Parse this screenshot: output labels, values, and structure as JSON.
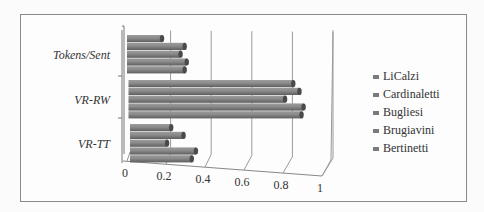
{
  "chart_data": {
    "type": "bar",
    "orientation": "horizontal",
    "style": "3d-cylinder",
    "title": "",
    "xlabel": "",
    "ylabel": "",
    "categories": [
      "Tokens/Sent",
      "VR-RW",
      "VR-TT"
    ],
    "xlim": [
      0,
      1
    ],
    "x_ticks": [
      "0",
      "0.2",
      "0.4",
      "0.6",
      "0.8",
      "1"
    ],
    "grid": true,
    "legend_position": "right",
    "series": [
      {
        "name": "LiCalzi",
        "values": [
          0.17,
          0.8,
          0.2
        ]
      },
      {
        "name": "Cardinaletti",
        "values": [
          0.28,
          0.83,
          0.26
        ]
      },
      {
        "name": "Bugliesi",
        "values": [
          0.26,
          0.76,
          0.18
        ]
      },
      {
        "name": "Brugiavini",
        "values": [
          0.29,
          0.85,
          0.32
        ]
      },
      {
        "name": "Bertinetti",
        "values": [
          0.28,
          0.84,
          0.3
        ]
      }
    ],
    "colors": {
      "bar": "#7a7a7a",
      "bar_highlight": "#9a9a9a",
      "bar_cap": "#4a4a4a",
      "grid": "#9a9a9a",
      "frame": "#8a8a8a"
    }
  }
}
